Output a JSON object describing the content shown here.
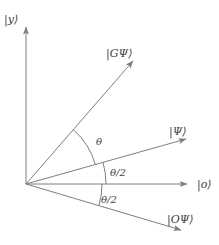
{
  "figure": {
    "colors": {
      "line": "#7e7e7e",
      "text": "#414141",
      "background": "#ffffff"
    },
    "axes": {
      "vertical_label": "|y⟩",
      "horizontal_label": "|o⟩"
    },
    "vectors": {
      "g_psi_label": "|GΨ⟩",
      "psi_label": "|Ψ⟩",
      "o_psi_label": "|OΨ⟩"
    },
    "angles": {
      "theta_label": "θ",
      "theta_half_upper_label": "θ/2",
      "theta_half_lower_label": "θ/2"
    }
  }
}
